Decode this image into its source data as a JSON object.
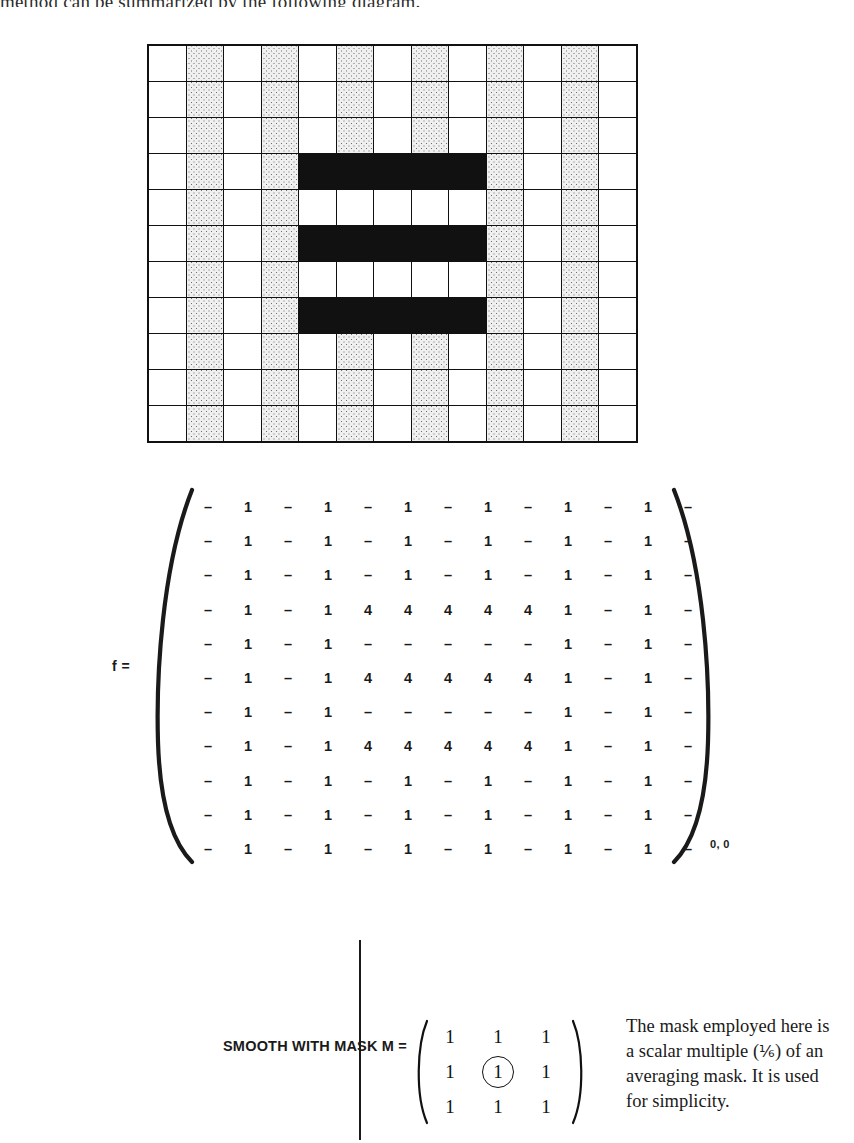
{
  "page": {
    "top_sentence": "method can be summarized by the following diagram."
  },
  "grid": {
    "name": "pixel-image-grid",
    "rows": 11,
    "cols": 13,
    "legend": {
      "white": "value 1 / background pixel",
      "dotted": "value – / stippled pixel",
      "black": "value 4 / object pixel"
    },
    "cells": [
      [
        "w",
        "d",
        "w",
        "d",
        "w",
        "d",
        "w",
        "d",
        "w",
        "d",
        "w",
        "d",
        "w"
      ],
      [
        "w",
        "d",
        "w",
        "d",
        "w",
        "d",
        "w",
        "d",
        "w",
        "d",
        "w",
        "d",
        "w"
      ],
      [
        "w",
        "d",
        "w",
        "d",
        "w",
        "d",
        "w",
        "d",
        "w",
        "d",
        "w",
        "d",
        "w"
      ],
      [
        "w",
        "d",
        "w",
        "d",
        "k",
        "k",
        "k",
        "k",
        "k",
        "d",
        "w",
        "d",
        "w"
      ],
      [
        "w",
        "d",
        "w",
        "d",
        "w",
        "w",
        "w",
        "w",
        "w",
        "d",
        "w",
        "d",
        "w"
      ],
      [
        "w",
        "d",
        "w",
        "d",
        "k",
        "k",
        "k",
        "k",
        "k",
        "d",
        "w",
        "d",
        "w"
      ],
      [
        "w",
        "d",
        "w",
        "d",
        "w",
        "w",
        "w",
        "w",
        "w",
        "d",
        "w",
        "d",
        "w"
      ],
      [
        "w",
        "d",
        "w",
        "d",
        "k",
        "k",
        "k",
        "k",
        "k",
        "d",
        "w",
        "d",
        "w"
      ],
      [
        "w",
        "d",
        "w",
        "d",
        "w",
        "d",
        "w",
        "d",
        "w",
        "d",
        "w",
        "d",
        "w"
      ],
      [
        "w",
        "d",
        "w",
        "d",
        "w",
        "d",
        "w",
        "d",
        "w",
        "d",
        "w",
        "d",
        "w"
      ],
      [
        "w",
        "d",
        "w",
        "d",
        "w",
        "d",
        "w",
        "d",
        "w",
        "d",
        "w",
        "d",
        "w"
      ]
    ]
  },
  "matrix_f": {
    "label": "f =",
    "origin_label": "0, 0",
    "rows": [
      [
        "–",
        "1",
        "–",
        "1",
        "–",
        "1",
        "–",
        "1",
        "–",
        "1",
        "–",
        "1",
        "–"
      ],
      [
        "–",
        "1",
        "–",
        "1",
        "–",
        "1",
        "–",
        "1",
        "–",
        "1",
        "–",
        "1",
        "–"
      ],
      [
        "–",
        "1",
        "–",
        "1",
        "–",
        "1",
        "–",
        "1",
        "–",
        "1",
        "–",
        "1",
        "–"
      ],
      [
        "–",
        "1",
        "–",
        "1",
        "4",
        "4",
        "4",
        "4",
        "4",
        "1",
        "–",
        "1",
        "–"
      ],
      [
        "–",
        "1",
        "–",
        "1",
        "–",
        "–",
        "–",
        "–",
        "–",
        "1",
        "–",
        "1",
        "–"
      ],
      [
        "–",
        "1",
        "–",
        "1",
        "4",
        "4",
        "4",
        "4",
        "4",
        "1",
        "–",
        "1",
        "–"
      ],
      [
        "–",
        "1",
        "–",
        "1",
        "–",
        "–",
        "–",
        "–",
        "–",
        "1",
        "–",
        "1",
        "–"
      ],
      [
        "–",
        "1",
        "–",
        "1",
        "4",
        "4",
        "4",
        "4",
        "4",
        "1",
        "–",
        "1",
        "–"
      ],
      [
        "–",
        "1",
        "–",
        "1",
        "–",
        "1",
        "–",
        "1",
        "–",
        "1",
        "–",
        "1",
        "–"
      ],
      [
        "–",
        "1",
        "–",
        "1",
        "–",
        "1",
        "–",
        "1",
        "–",
        "1",
        "–",
        "1",
        "–"
      ],
      [
        "–",
        "1",
        "–",
        "1",
        "–",
        "1",
        "–",
        "1",
        "–",
        "1",
        "–",
        "1",
        "–"
      ]
    ]
  },
  "mask": {
    "caption": "SMOOTH WITH MASK M =",
    "rows": [
      [
        "1",
        "1",
        "1"
      ],
      [
        "1",
        "1",
        "1"
      ],
      [
        "1",
        "1",
        "1"
      ]
    ],
    "circled_cell": {
      "row": 1,
      "col": 1
    },
    "note_line1": "The mask employed here is",
    "note_line2_pre": "a scalar multiple (",
    "note_fraction": "⅙",
    "note_line2_post": ") of an",
    "note_line3": "averaging mask. It is used",
    "note_line4": "for simplicity."
  },
  "colors": {
    "ink": "#1a1a1a",
    "black_cell": "#111111",
    "dotted_cell_bg": "#f0f0f0",
    "dot": "#6d6d6d",
    "paper": "#ffffff"
  }
}
